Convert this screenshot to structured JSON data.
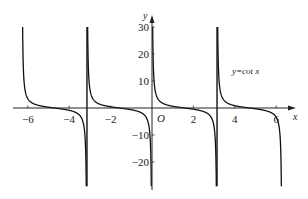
{
  "chart_data": {
    "type": "line",
    "title": "",
    "function": "y = cot x",
    "xlabel": "x",
    "ylabel": "y",
    "origin_label": "O",
    "xlim": [
      -6.8,
      7.2
    ],
    "ylim": [
      -29,
      30
    ],
    "x_ticks": [
      -6,
      -4,
      -2,
      2,
      4,
      6
    ],
    "x_tick_labels": [
      "-6",
      "-4",
      "-2",
      "2",
      "4",
      "6"
    ],
    "y_ticks": [
      30,
      20,
      10,
      -10,
      -20
    ],
    "y_tick_labels": [
      "30",
      "20",
      "10",
      "-10",
      "-20"
    ],
    "asymptotes": [
      -6.2832,
      -3.1416,
      0,
      3.1416,
      6.2832
    ],
    "grid": false,
    "series": [
      {
        "name": "y=cot x",
        "color": "#111111",
        "domain": [
          -6.2832,
          6.2832
        ],
        "sample_points": [
          {
            "x": -6.25,
            "y": 30
          },
          {
            "x": -6.0,
            "y": 3.44
          },
          {
            "x": -5.5,
            "y": 0.71
          },
          {
            "x": -5.0,
            "y": 0.3
          },
          {
            "x": -4.71,
            "y": 0
          },
          {
            "x": -4.0,
            "y": -0.86
          },
          {
            "x": -3.5,
            "y": -2.67
          },
          {
            "x": -3.18,
            "y": -29
          },
          {
            "x": -3.11,
            "y": 30
          },
          {
            "x": -2.5,
            "y": 1.34
          },
          {
            "x": -1.57,
            "y": 0
          },
          {
            "x": -0.5,
            "y": -1.83
          },
          {
            "x": -0.04,
            "y": -29
          },
          {
            "x": 0.04,
            "y": 29
          },
          {
            "x": 0.5,
            "y": 1.83
          },
          {
            "x": 1.57,
            "y": 0
          },
          {
            "x": 2.5,
            "y": -1.34
          },
          {
            "x": 3.11,
            "y": -29
          },
          {
            "x": 3.18,
            "y": 30
          },
          {
            "x": 4.0,
            "y": 0.86
          },
          {
            "x": 4.71,
            "y": 0
          },
          {
            "x": 5.5,
            "y": -0.71
          },
          {
            "x": 6.0,
            "y": -3.44
          },
          {
            "x": 6.25,
            "y": -29
          }
        ]
      }
    ],
    "legend": {
      "text": "y=cot x",
      "position": "upper-right"
    }
  }
}
